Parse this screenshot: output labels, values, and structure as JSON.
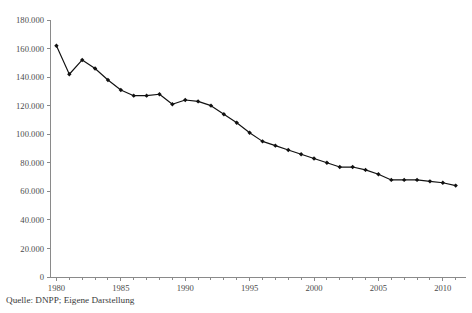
{
  "caption": "Quelle: DNPP; Eigene Darstellung",
  "chart_data": {
    "type": "line",
    "title": "",
    "xlabel": "",
    "ylabel": "",
    "xlim": [
      1979.5,
      2011.8
    ],
    "ylim": [
      0,
      180000
    ],
    "grid": false,
    "legend": null,
    "marker": "diamond",
    "line_color": "#111111",
    "axis_color": "#8a8a8a",
    "number_format": "de-DE thousands separator is a period",
    "x": [
      1980,
      1981,
      1982,
      1983,
      1984,
      1985,
      1986,
      1987,
      1988,
      1989,
      1990,
      1991,
      1992,
      1993,
      1994,
      1995,
      1996,
      1997,
      1998,
      1999,
      2000,
      2001,
      2002,
      2003,
      2004,
      2005,
      2006,
      2007,
      2008,
      2009,
      2010,
      2011
    ],
    "values": [
      162000,
      142000,
      152000,
      146000,
      138000,
      131000,
      127000,
      127000,
      128000,
      121000,
      124000,
      123000,
      120000,
      114000,
      108000,
      101000,
      95000,
      92000,
      89000,
      86000,
      83000,
      80000,
      77000,
      77000,
      75000,
      72000,
      68000,
      68000,
      68000,
      67000,
      66000,
      64000
    ],
    "xticks": [
      1980,
      1985,
      1990,
      1995,
      2000,
      2005,
      2010
    ],
    "xtick_labels": [
      "1980",
      "1985",
      "1990",
      "1995",
      "2000",
      "2005",
      "2010"
    ],
    "xminor_step": 1,
    "yticks": [
      0,
      20000,
      40000,
      60000,
      80000,
      100000,
      120000,
      140000,
      160000,
      180000
    ],
    "ytick_labels": [
      "0",
      "20.000",
      "40.000",
      "60.000",
      "80.000",
      "100.000",
      "120.000",
      "140.000",
      "160.000",
      "180.000"
    ]
  }
}
